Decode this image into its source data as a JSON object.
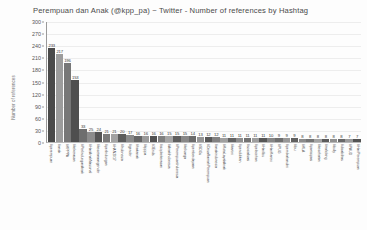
{
  "chart_data": {
    "type": "bar",
    "title": "Perempuan dan Anak (@kpp_pa) ~ Twitter - Number of references by Hashtag",
    "xlabel": "",
    "ylabel": "Number of references",
    "ylim": [
      0,
      300
    ],
    "yticks": [
      0,
      30,
      60,
      90,
      120,
      150,
      180,
      210,
      240,
      270,
      300
    ],
    "grid": true,
    "legend": "none",
    "categories": [
      "#perempuan",
      "#anak",
      "#KPPPA",
      "#kekerasan",
      "#PerlindunganAnak",
      "#HariAnakNasional",
      "#kesetaraangender",
      "#perlindungan",
      "#HAN2017",
      "#Indonesia",
      "#gender",
      "#hakanak",
      "#kpppa",
      "#3Ends",
      "#stopkekerasan",
      "#AnakIndonesia",
      "#PerempuanIndonesia",
      "#keluarga",
      "#pemberdayaan",
      "#SDGs",
      "#DesaRamahPerempuan",
      "#anakindonesia",
      "#KotaLayakAnak",
      "#kartini",
      "#pendidikan",
      "#sosialisasi",
      "#pelecehan",
      "#HariIbu",
      "#HariKartini",
      "#PUG",
      "#pernikahandini",
      "#ibu",
      "#KLA",
      "#partisipasi",
      "#kesehatan",
      "#traficking",
      "#bully",
      "#disabilitas",
      "#PAUD",
      "#HariPerempuan"
    ],
    "values": [
      233,
      217,
      196,
      153,
      33,
      25,
      24,
      21,
      21,
      20,
      17,
      16,
      16,
      16,
      16,
      15,
      15,
      15,
      14,
      13,
      12,
      12,
      11,
      11,
      11,
      11,
      11,
      11,
      10,
      9,
      9,
      9,
      8,
      8,
      8,
      8,
      8,
      8,
      7,
      7
    ],
    "bar_colors": [
      "#4a4a4a",
      "#9c9c9c",
      "#777777",
      "#4f4f4f",
      "#6e6e6e",
      "#8c8c8c",
      "#555555",
      "#7a7a7a",
      "#a2a2a2",
      "#5c5c5c",
      "#8a8a8a",
      "#666666",
      "#9a9a9a",
      "#515151",
      "#7f7f7f",
      "#a5a5a5",
      "#5e5e5e",
      "#888888",
      "#6b6b6b",
      "#959595",
      "#585858",
      "#828282",
      "#a0a0a0",
      "#636363",
      "#8e8e8e",
      "#727272",
      "#9e9e9e",
      "#565656",
      "#868686",
      "#6f6f6f",
      "#989898",
      "#606060",
      "#8b8b8b",
      "#757575",
      "#a3a3a3",
      "#5a5a5a",
      "#909090",
      "#686868",
      "#9b9b9b",
      "#535353"
    ]
  },
  "colors": {
    "background": "#ffffff",
    "axis": "#9a9a9a",
    "grid": "#ededed",
    "text": "#4a4a4a"
  }
}
